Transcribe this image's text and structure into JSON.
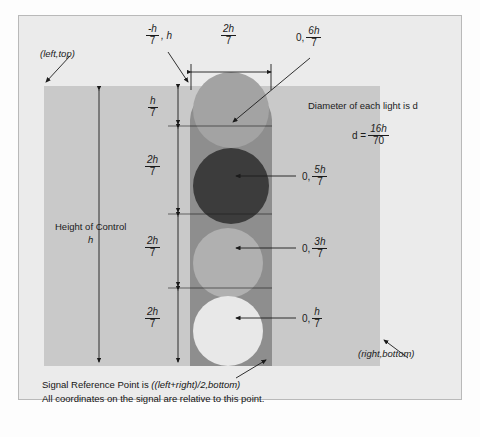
{
  "diagram": {
    "corner_labels": {
      "top_left": "(left,top)",
      "bottom_right": "(right,bottom)"
    },
    "top_dimensions": {
      "offset_label_prefix": "-h",
      "offset_label_denominator": "7",
      "offset_label_suffix": ", h",
      "width_numerator": "2h",
      "width_denominator": "7"
    },
    "height_label": {
      "line1": "Height of Control",
      "line2": "h"
    },
    "vertical_segments": [
      {
        "numerator": "h",
        "denominator": "7"
      },
      {
        "numerator": "2h",
        "denominator": "7"
      },
      {
        "numerator": "2h",
        "denominator": "7"
      },
      {
        "numerator": "2h",
        "denominator": "7"
      }
    ],
    "lamp_callouts": [
      {
        "prefix": "0,",
        "numerator": "6h",
        "denominator": "7"
      },
      {
        "prefix": "0,",
        "numerator": "5h",
        "denominator": "7"
      },
      {
        "prefix": "0,",
        "numerator": "3h",
        "denominator": "7"
      },
      {
        "prefix": "0,",
        "numerator": "h",
        "denominator": "7"
      }
    ],
    "diameter_note": {
      "text": "Diameter of each light is d",
      "formula_lhs": "d =",
      "formula_numerator": "16h",
      "formula_denominator": "70"
    },
    "footer_note": {
      "line1_plain": "Signal Reference Point is ",
      "line1_italic": "((left+right)/2,bottom)",
      "line2": "All coordinates on the signal are relative to this point."
    },
    "colors": {
      "page": "#fdfdfd",
      "frame": "#ebebeb",
      "frame_border": "#b9b9b9",
      "control_area": "#c9c9c9",
      "housing": "#8e8e8e",
      "lamp_top": "#a3a3a3",
      "lamp_red": "#3c3c3c",
      "lamp_amber": "#b0b0b0",
      "lamp_green": "#e8e8e8",
      "ink": "#1b1b1b"
    }
  }
}
